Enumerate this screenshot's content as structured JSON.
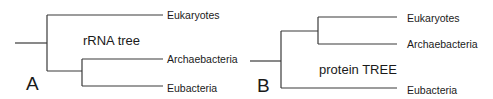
{
  "trees": [
    {
      "panel": "A",
      "title": "rRNA tree",
      "leaves": [
        "Eukaryotes",
        "Archaebacteria",
        "Eubacteria"
      ]
    },
    {
      "panel": "B",
      "title": "protein TREE",
      "leaves": [
        "Eukaryotes",
        "Archaebacteria",
        "Eubacteria"
      ]
    }
  ],
  "colors": {
    "line": "#3a3a3a",
    "text": "#1a1a1a"
  }
}
